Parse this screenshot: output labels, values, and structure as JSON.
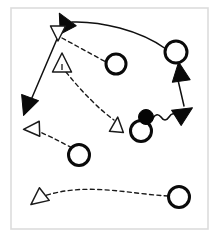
{
  "diagram": {
    "canvas": {
      "width": 219,
      "height": 239,
      "background": "#ffffff"
    },
    "frame": {
      "x": 11,
      "y": 8,
      "width": 197,
      "height": 221,
      "stroke": "#dcdcdc"
    },
    "colors": {
      "ink": "#101010",
      "hollow_fill": "#ffffff",
      "frame": "#dcdcdc",
      "ball": "#050505"
    },
    "legend": {
      "open_circle": "player-position",
      "filled_circle": "ball",
      "open_triangle": "movement-destination",
      "filled_triangle": "pass-arrowhead",
      "solid_line": "pass-or-run-path",
      "dashed_line": "player-movement-path",
      "wavy_line": "dribble-path"
    },
    "players": [
      {
        "id": "p1",
        "label": "",
        "shape": "circle",
        "x": 116,
        "y": 64,
        "r": 10
      },
      {
        "id": "p2",
        "label": "",
        "shape": "circle",
        "x": 176,
        "y": 52,
        "r": 11
      },
      {
        "id": "p3",
        "label": "",
        "shape": "circle",
        "x": 141,
        "y": 131,
        "r": 10.5
      },
      {
        "id": "p4",
        "label": "",
        "shape": "circle",
        "x": 79,
        "y": 155,
        "r": 10.5
      },
      {
        "id": "p5",
        "label": "",
        "shape": "circle",
        "x": 179,
        "y": 197,
        "r": 10.5
      }
    ],
    "ball": {
      "id": "ball",
      "label": "",
      "x": 146,
      "y": 117,
      "r": 7.5
    },
    "markers": [
      {
        "id": "m1",
        "type": "filled-arrowhead",
        "direction": "up-left",
        "x": 64,
        "y": 22,
        "angle": -28
      },
      {
        "id": "m2",
        "type": "hollow-triangle",
        "direction": "down",
        "x": 58,
        "y": 33,
        "angle": 180
      },
      {
        "id": "m3",
        "type": "hollow-triangle",
        "direction": "up",
        "x": 62,
        "y": 63,
        "angle": 0
      },
      {
        "id": "m4",
        "type": "filled-arrowhead",
        "direction": "down-left",
        "x": 27,
        "y": 106,
        "angle": 200
      },
      {
        "id": "m5",
        "type": "hollow-triangle",
        "direction": "left",
        "x": 32,
        "y": 129,
        "angle": 268
      },
      {
        "id": "m6",
        "type": "hollow-triangle",
        "direction": "up-right",
        "x": 117,
        "y": 125,
        "angle": 5
      },
      {
        "id": "m7",
        "type": "filled-arrowhead",
        "direction": "up",
        "x": 180,
        "y": 72,
        "angle": -8
      },
      {
        "id": "m8",
        "type": "filled-arrowhead",
        "direction": "right-down",
        "x": 184,
        "y": 113,
        "angle": 58
      },
      {
        "id": "m9",
        "type": "hollow-triangle",
        "direction": "down-left",
        "x": 38,
        "y": 199,
        "angle": 232
      }
    ],
    "paths": [
      {
        "id": "path-pass-top",
        "style": "solid",
        "from": "p2",
        "to": "m1",
        "d": "M 166 49 C 140 30 100 21 72 22"
      },
      {
        "id": "path-run-left",
        "style": "solid",
        "from": "m2",
        "to": "m4",
        "d": "M 57 39 L 31 100"
      },
      {
        "id": "path-cut-topleft",
        "style": "dashed",
        "from": "m2",
        "to": "p1",
        "d": "M 62 38 L 106 62"
      },
      {
        "id": "path-cut-center",
        "style": "dashed",
        "from": "m3",
        "to": "m6",
        "d": "M 66 72 C 82 92 100 110 114 120"
      },
      {
        "id": "path-run-right",
        "style": "solid",
        "from": "m8",
        "to": "m7",
        "d": "M 184 106 L 178 80"
      },
      {
        "id": "path-dribble",
        "style": "wavy",
        "from": "ball",
        "to": "m8",
        "d": "M 153 118 q 4 -6 8 -1 q 4 6 8 0 q 4 -6 8 -1 q 3 4 6 1"
      },
      {
        "id": "path-cut-lowerleft",
        "style": "dashed",
        "from": "p4",
        "to": "m5",
        "d": "M 72 148 C 58 140 44 134 36 130"
      },
      {
        "id": "path-cut-bottom",
        "style": "dashed",
        "from": "p5",
        "to": "m9",
        "d": "M 168 196 C 130 194 86 182 44 196"
      }
    ]
  }
}
